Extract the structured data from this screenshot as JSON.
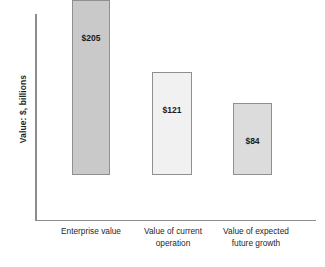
{
  "chart_data": {
    "type": "bar",
    "title": "",
    "subtitle": "",
    "xlabel": "",
    "ylabel": "Value: $, billions",
    "ylim": [
      0,
      240
    ],
    "grid": false,
    "legend": "none",
    "categories": [
      "Enterprise value",
      "Value of current operation",
      "Value of expected future growth"
    ],
    "category_lines": [
      [
        "Enterprise value"
      ],
      [
        "Value of current",
        "operation"
      ],
      [
        "Value of expected",
        "future growth"
      ]
    ],
    "values": [
      205,
      121,
      84
    ],
    "value_labels": [
      "$205",
      "$121",
      "$84"
    ],
    "bar_colors": [
      "#c9c9c9",
      "#f1f1f1",
      "#dcdcdc"
    ],
    "bar_border_color": "#8f8f8f",
    "axis_color": "#8d8d8d"
  },
  "axis": {
    "y_title": "Value: $, billions"
  },
  "bars": [
    {
      "label": "Enterprise value",
      "value_label": "$205",
      "line1": "Enterprise value",
      "line2": ""
    },
    {
      "label": "Value of current operation",
      "value_label": "$121",
      "line1": "Value of current",
      "line2": "operation"
    },
    {
      "label": "Value of expected future growth",
      "value_label": "$84",
      "line1": "Value of expected",
      "line2": "future growth"
    }
  ]
}
